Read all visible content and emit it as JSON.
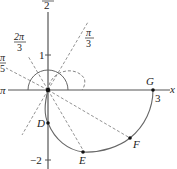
{
  "diagram": {
    "type": "polar-graph",
    "origin_px": [
      48,
      90
    ],
    "axis_labels": {
      "top": "2",
      "left": "π",
      "right": "x"
    },
    "ticks": {
      "pos_one": "1",
      "neg_two": "−2",
      "three": "3"
    },
    "angle_labels": [
      {
        "num": "π",
        "den": "3",
        "name": "pi-over-3"
      },
      {
        "num": "2π",
        "den": "3",
        "name": "two-pi-over-3"
      },
      {
        "num": "π",
        "den": "5",
        "name": "pi-over-5-partial"
      }
    ],
    "points": [
      {
        "label": "D",
        "name": "point-d"
      },
      {
        "label": "E",
        "name": "point-e"
      },
      {
        "label": "F",
        "name": "point-f"
      },
      {
        "label": "G",
        "name": "point-g"
      }
    ],
    "colors": {
      "axis": "#555555",
      "curve": "#666666",
      "dashed": "#777777",
      "text": "#222222"
    }
  }
}
